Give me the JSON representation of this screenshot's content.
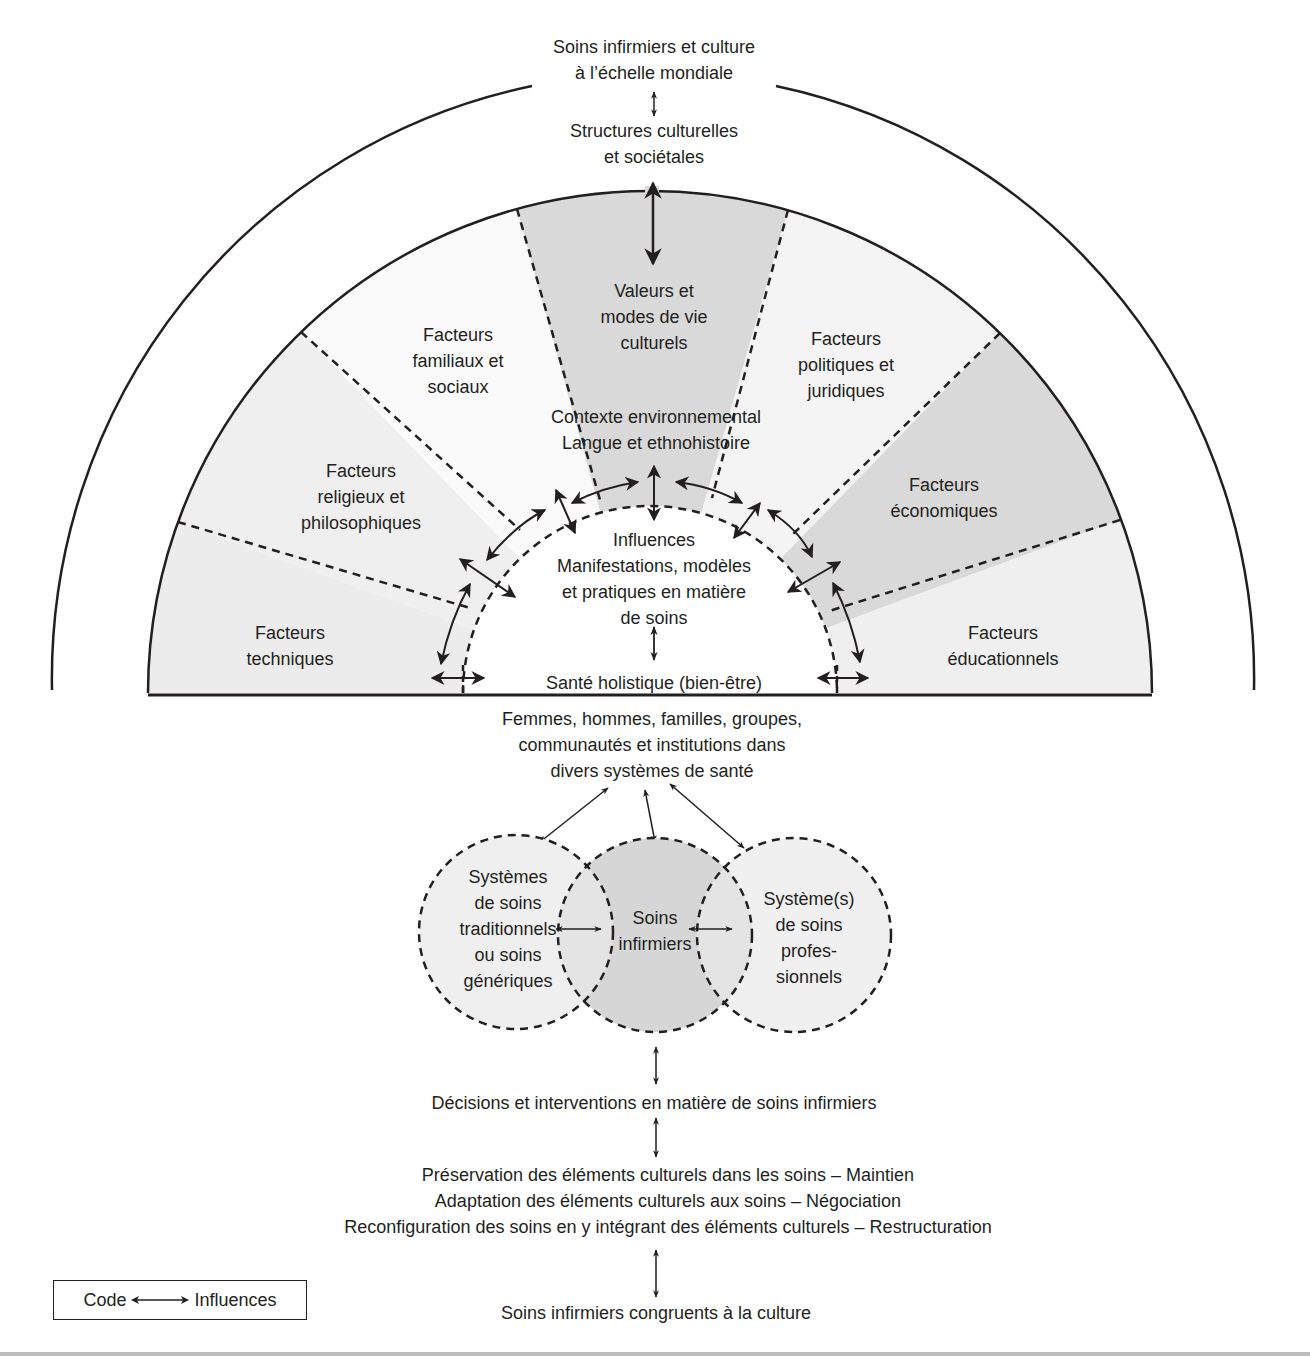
{
  "title": {
    "lines": [
      "Soins infirmiers et culture",
      "à l’échelle mondiale"
    ]
  },
  "structures": {
    "lines": [
      "Structures culturelles",
      "et sociétales"
    ]
  },
  "sectors": [
    {
      "id": "techniques",
      "lines": [
        "Facteurs",
        "techniques"
      ],
      "fill": "#ececec"
    },
    {
      "id": "religieux",
      "lines": [
        "Facteurs",
        "religieux et",
        "philosophiques"
      ],
      "fill": "#efefef"
    },
    {
      "id": "familiaux",
      "lines": [
        "Facteurs",
        "familiaux et",
        "sociaux"
      ],
      "fill": "#fafafa"
    },
    {
      "id": "valeurs",
      "lines": [
        "Valeurs et",
        "modes de vie",
        "culturels"
      ],
      "fill": "#d9d9d9"
    },
    {
      "id": "politiques",
      "lines": [
        "Facteurs",
        "politiques et",
        "juridiques"
      ],
      "fill": "#f4f4f4"
    },
    {
      "id": "economiques",
      "lines": [
        "Facteurs",
        "économiques"
      ],
      "fill": "#d9d9d9"
    },
    {
      "id": "educationnels",
      "lines": [
        "Facteurs",
        "éducationnels"
      ],
      "fill": "#efefef"
    }
  ],
  "context": {
    "lines": [
      "Contexte environnemental",
      "Langue et ethnohistoire"
    ]
  },
  "influences": {
    "lines": [
      "Influences",
      "Manifestations, modèles",
      "et pratiques en matière",
      "de soins"
    ]
  },
  "holistic": {
    "text": "Santé holistique (bien-être)"
  },
  "people": {
    "lines": [
      "Femmes, hommes, familles, groupes,",
      "communautés et institutions dans",
      "divers systèmes de santé"
    ]
  },
  "circles": [
    {
      "id": "traditional",
      "lines": [
        "Systèmes",
        "de soins",
        "traditionnels",
        "ou soins",
        "génériques"
      ],
      "fill": "#efefef"
    },
    {
      "id": "nursing",
      "lines": [
        "Soins",
        "infirmiers"
      ],
      "fill": "#d6d6d6"
    },
    {
      "id": "professional",
      "lines": [
        "Système(s)",
        "de soins",
        "profes-",
        "sionnels"
      ],
      "fill": "#f0f0f0"
    }
  ],
  "decisions": {
    "text": "Décisions et interventions en matière de soins infirmiers"
  },
  "modes": {
    "lines": [
      "Préservation des éléments culturels dans les soins – Maintien",
      "Adaptation des éléments culturels aux soins – Négociation",
      "Reconfiguration des soins en y intégrant des éléments culturels – Restructuration"
    ]
  },
  "outcome": {
    "text": "Soins infirmiers congruents à la culture"
  },
  "legend": {
    "code_label": "Code",
    "influence_label": "Influences"
  },
  "colors": {
    "ink": "#231f20",
    "rule": "#bdbdbd"
  }
}
